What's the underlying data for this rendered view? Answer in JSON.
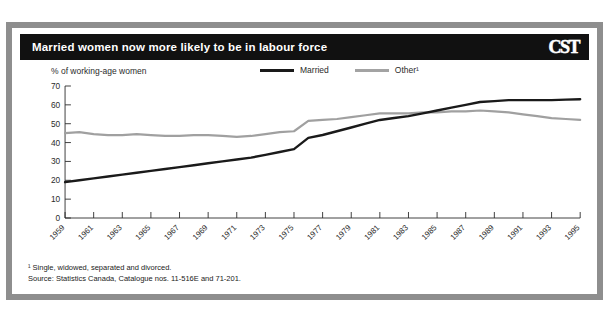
{
  "header": {
    "title": "Married women now more likely to be in labour force",
    "logo": "CST"
  },
  "chart_data": {
    "type": "line",
    "title": "Married women now more likely to be in labour force",
    "ylabel": "% of working-age women",
    "xlabel": "",
    "ylim": [
      0,
      70
    ],
    "yticks": [
      0,
      10,
      20,
      30,
      40,
      50,
      60,
      70
    ],
    "grid": false,
    "legend_position": "top-center",
    "x": [
      1959,
      1960,
      1961,
      1962,
      1963,
      1964,
      1965,
      1966,
      1967,
      1968,
      1969,
      1970,
      1971,
      1972,
      1973,
      1974,
      1975,
      1976,
      1977,
      1978,
      1979,
      1980,
      1981,
      1982,
      1983,
      1984,
      1985,
      1986,
      1987,
      1988,
      1989,
      1990,
      1991,
      1992,
      1993,
      1994,
      1995
    ],
    "xtick_labels": [
      "1959",
      "1961",
      "1963",
      "1965",
      "1967",
      "1969",
      "1971",
      "1973",
      "1975",
      "1977",
      "1979",
      "1981",
      "1983",
      "1985",
      "1987",
      "1989",
      "1991",
      "1993",
      "1995"
    ],
    "series": [
      {
        "name": "Married",
        "color": "#1a1a1a",
        "values": [
          19.0,
          20.0,
          21.0,
          22.0,
          23.0,
          24.0,
          25.0,
          26.0,
          27.0,
          28.0,
          29.0,
          30.0,
          31.0,
          32.0,
          33.5,
          35.0,
          36.5,
          42.5,
          44.0,
          46.0,
          48.0,
          50.0,
          52.0,
          53.0,
          54.0,
          55.5,
          57.0,
          58.5,
          60.0,
          61.5,
          62.0,
          62.5,
          62.5,
          62.5,
          62.5,
          62.8,
          63.0
        ]
      },
      {
        "name": "Other¹",
        "color": "#a0a0a0",
        "values": [
          45.0,
          45.5,
          44.5,
          44.0,
          44.0,
          44.5,
          44.0,
          43.5,
          43.5,
          44.0,
          44.0,
          43.5,
          43.0,
          43.5,
          44.5,
          45.5,
          46.0,
          51.5,
          52.0,
          52.5,
          53.5,
          54.5,
          55.5,
          55.5,
          55.5,
          56.0,
          56.0,
          56.5,
          56.5,
          57.0,
          56.5,
          56.0,
          55.0,
          54.0,
          53.0,
          52.5,
          52.0
        ]
      }
    ]
  },
  "legend": [
    {
      "label": "Married",
      "key": "married"
    },
    {
      "label": "Other¹",
      "key": "other"
    }
  ],
  "footnotes": {
    "note": "¹ Single, widowed, separated and divorced.",
    "source": "Source: Statistics Canada, Catalogue nos. 11-516E and 71-201."
  }
}
